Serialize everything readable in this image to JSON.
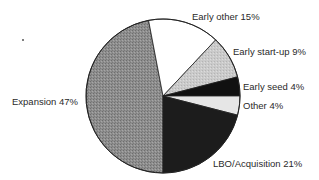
{
  "chart_data": {
    "type": "pie",
    "title": "",
    "categories": [
      "Expansion",
      "Early other",
      "Early start-up",
      "Early seed",
      "Other",
      "LBO/Acquisition"
    ],
    "values": [
      47,
      15,
      9,
      4,
      4,
      21
    ],
    "unit": "%",
    "colors": [
      "#8c8c8c",
      "#ffffff",
      "#c9c9c9",
      "#111111",
      "#e6e6e6",
      "#1c1c1c"
    ],
    "labels": [
      "Expansion 47%",
      "Early other 15%",
      "Early start-up 9%",
      "Early seed 4%",
      "Other 4%",
      "LBO/Acquisition 21%"
    ],
    "start_angle_deg": 180,
    "direction": "clockwise",
    "legend": "none (direct labels)"
  },
  "labels": {
    "expansion": "Expansion 47%",
    "early_other": "Early other 15%",
    "early_startup": "Early start-up 9%",
    "early_seed": "Early seed 4%",
    "other": "Other 4%",
    "lbo": "LBO/Acquisition 21%"
  }
}
